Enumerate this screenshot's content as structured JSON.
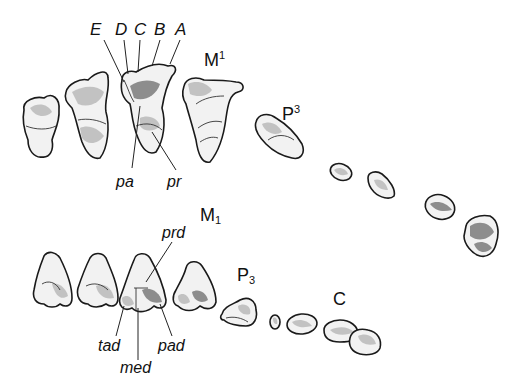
{
  "figure": {
    "upper_row": {
      "cusp_labels": [
        "E",
        "D",
        "C",
        "B",
        "A"
      ],
      "tooth_labels": {
        "molar": "M",
        "molar_index": "1",
        "premolar": "P",
        "premolar_index": "3"
      },
      "part_labels": {
        "paracone": "pa",
        "protocone": "pr"
      }
    },
    "lower_row": {
      "tooth_labels": {
        "molar": "M",
        "molar_index": "1",
        "premolar": "P",
        "premolar_index": "3",
        "canine": "C"
      },
      "part_labels": {
        "protoconid": "prd",
        "hypoconid_tad": "tad",
        "metaconid": "med",
        "paraconid": "pad"
      }
    },
    "colors": {
      "ink": "#1a1a1a",
      "tooth_fill": "#f2f2f2",
      "background": "#ffffff"
    }
  }
}
